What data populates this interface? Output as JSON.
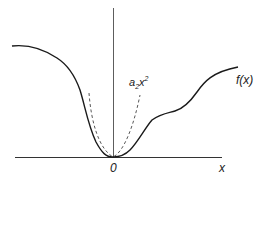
{
  "diagram": {
    "origin_label": "0",
    "x_axis_label": "x",
    "curve_label": "f(x)",
    "approx_label_base": "a",
    "approx_label_sub": "2",
    "approx_label_var": "x",
    "approx_label_sup": "2",
    "colors": {
      "stroke": "#1a1a1a",
      "axis": "#333333",
      "dashed": "#444444"
    }
  }
}
